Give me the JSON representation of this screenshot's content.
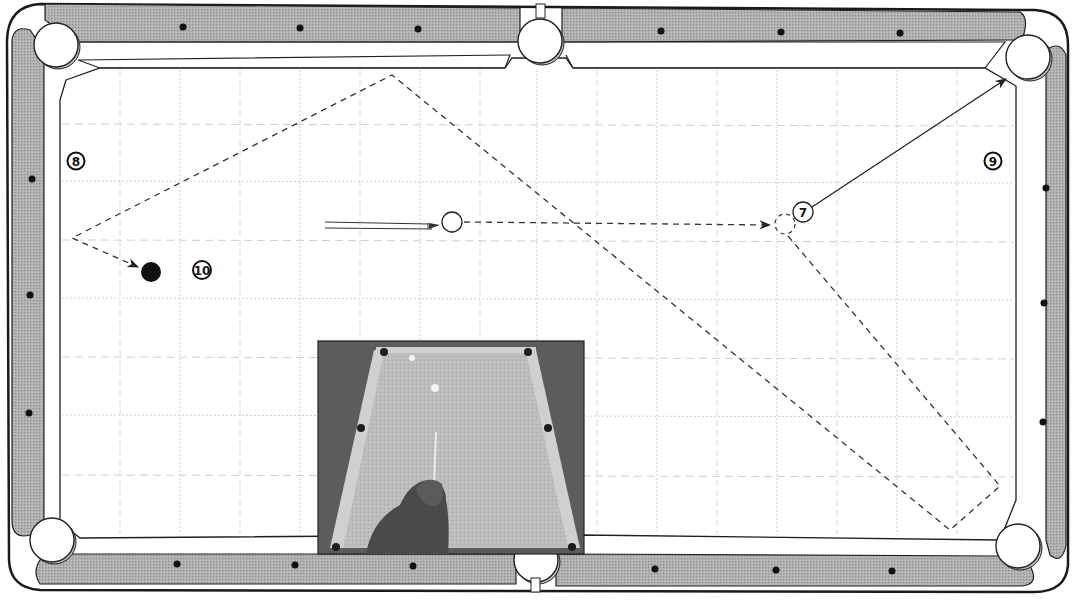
{
  "diagram": {
    "type": "billiards-shot-diagram",
    "colors": {
      "rail": "#a8a8a8",
      "cushion": "#ffffff",
      "cloth": "#ffffff",
      "outline": "#1a1a1a",
      "grid": "#c8c8c8",
      "path": "#333333",
      "diamond": "#111111",
      "photo_bg": "#5a5a5a",
      "photo_cloth": "#b9b9b9"
    },
    "ball_labels": {
      "seven": "⑦",
      "eight": "⑧",
      "nine": "⑨",
      "ten": "⑩"
    },
    "balls": [
      {
        "id": "cue-ball",
        "label": "",
        "style": "white"
      },
      {
        "id": "object-ball-7",
        "label": "7",
        "style": "numbered"
      },
      {
        "id": "ball-8-position",
        "label": "8",
        "style": "numbered"
      },
      {
        "id": "ball-9-position",
        "label": "9",
        "style": "numbered"
      },
      {
        "id": "ball-10-position",
        "label": "10",
        "style": "numbered"
      },
      {
        "id": "cue-ball-final",
        "label": "",
        "style": "black"
      }
    ],
    "paths": [
      {
        "id": "cue-ball-to-ghost",
        "style": "dashed",
        "arrow": true
      },
      {
        "id": "object-ball-to-pocket",
        "style": "solid",
        "arrow": true
      },
      {
        "id": "cue-ball-after-contact",
        "style": "dashed",
        "arrow": true
      }
    ],
    "inset_photo": {
      "description": "player shooting on pool table, viewed from behind"
    }
  }
}
